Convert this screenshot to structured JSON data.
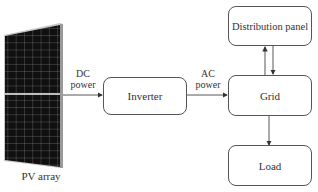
{
  "diagram": {
    "nodes": {
      "pv_array": {
        "label": "PV array"
      },
      "inverter": {
        "label": "Inverter"
      },
      "grid": {
        "label": "Grid"
      },
      "distribution_panel": {
        "label": "Distribution panel"
      },
      "load": {
        "label": "Load"
      }
    },
    "edges": {
      "dc": {
        "line1": "DC",
        "line2": "power"
      },
      "ac": {
        "line1": "AC",
        "line2": "power"
      }
    },
    "colors": {
      "stroke": "#555555",
      "panel_cell": "#111111",
      "panel_frame": "#9a9a9a"
    }
  }
}
